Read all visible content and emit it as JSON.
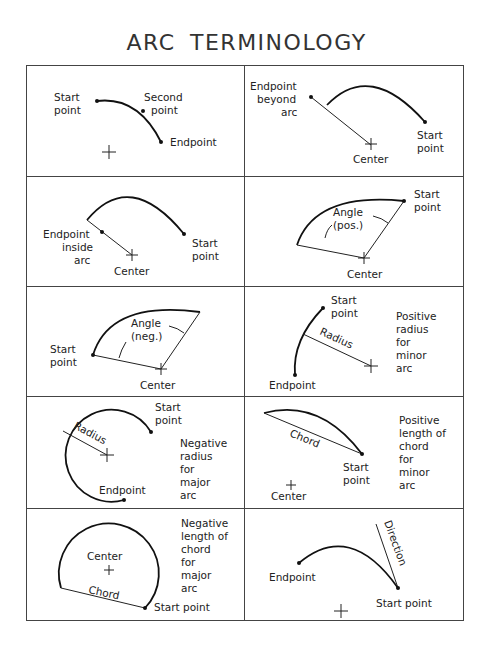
{
  "title": "ARC TERMINOLOGY",
  "panels": [
    {
      "id": "three-point",
      "labels": {
        "start": [
          "Start",
          "point"
        ],
        "second": [
          "Second",
          "point"
        ],
        "end": "Endpoint"
      }
    },
    {
      "id": "endpoint-beyond",
      "labels": {
        "endpoint": [
          "Endpoint",
          "beyond",
          "arc"
        ],
        "start": [
          "Start",
          "point"
        ],
        "center": "Center"
      }
    },
    {
      "id": "endpoint-inside",
      "labels": {
        "endpoint": [
          "Endpoint",
          "inside",
          "arc"
        ],
        "start": [
          "Start",
          "point"
        ],
        "center": "Center"
      }
    },
    {
      "id": "angle-positive",
      "labels": {
        "angle": [
          "Angle",
          "(pos.)"
        ],
        "start": [
          "Start",
          "point"
        ],
        "center": "Center"
      }
    },
    {
      "id": "angle-negative",
      "labels": {
        "angle": [
          "Angle",
          "(neg.)"
        ],
        "start": [
          "Start",
          "point"
        ],
        "center": "Center"
      }
    },
    {
      "id": "radius-positive",
      "labels": {
        "start": [
          "Start",
          "point"
        ],
        "radius": "Radius",
        "end": "Endpoint",
        "note": [
          "Positive",
          "radius",
          "for",
          "minor",
          "arc"
        ]
      }
    },
    {
      "id": "radius-negative",
      "labels": {
        "start": [
          "Start",
          "point"
        ],
        "radius": "Radius",
        "end": "Endpoint",
        "note": [
          "Negative",
          "radius",
          "for",
          "major",
          "arc"
        ]
      }
    },
    {
      "id": "chord-positive",
      "labels": {
        "chord": "Chord",
        "start": [
          "Start",
          "point"
        ],
        "center": "Center",
        "note": [
          "Positive",
          "length  of",
          "chord",
          "for",
          "minor",
          "arc"
        ]
      }
    },
    {
      "id": "chord-negative",
      "labels": {
        "center": "Center",
        "chord": "Chord",
        "start": "Start  point",
        "note": [
          "Negative",
          "length  of",
          "chord",
          "for",
          "major",
          "arc"
        ]
      }
    },
    {
      "id": "direction",
      "labels": {
        "direction": "Direction",
        "end": "Endpoint",
        "start": "Start  point"
      }
    }
  ]
}
